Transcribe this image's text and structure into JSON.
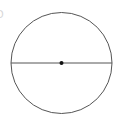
{
  "diagram": {
    "type": "circle-with-diameter",
    "circle": {
      "cx": 61.5,
      "cy": 63,
      "r": 50.5,
      "stroke": "#555555",
      "fill": "none"
    },
    "diameter": {
      "x1": 11,
      "y1": 63,
      "x2": 112,
      "y2": 63,
      "stroke": "#555555"
    },
    "center_point": {
      "cx": 61.5,
      "cy": 63,
      "r": 2,
      "fill": "#111111"
    },
    "edge_mark": "D"
  }
}
